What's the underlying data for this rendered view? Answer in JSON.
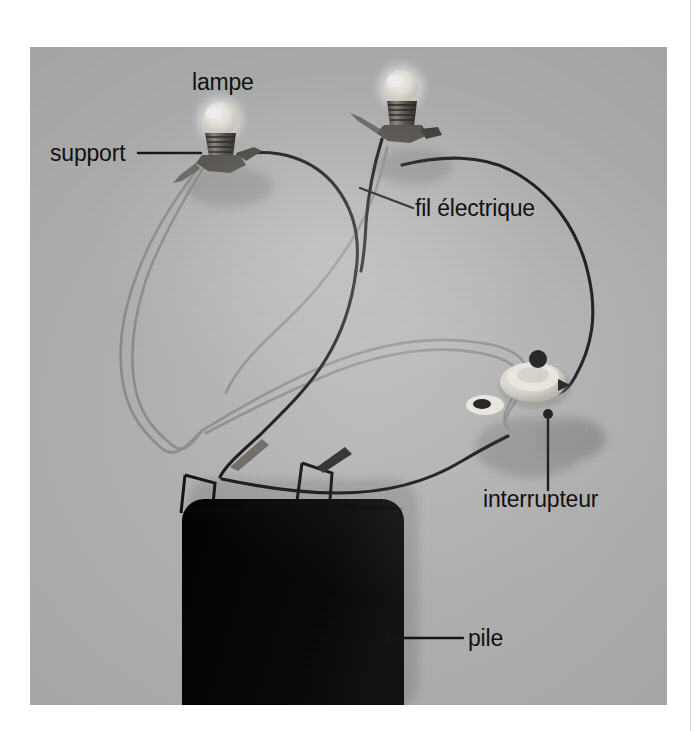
{
  "page": {
    "background_color": "#ffffff",
    "sheet_edge_color": "#d9d9d9"
  },
  "photo": {
    "caption_language": "fr",
    "subject": "montage de circuit electrique avec deux lampes, une pile et un interrupteur",
    "background_color": "#b7b7b7",
    "frame": {
      "x": 30,
      "y": 47,
      "width": 637,
      "height": 658
    }
  },
  "annotations": [
    {
      "id": "lampe",
      "label": "lampe",
      "name": "annotation-lampe",
      "leader": "none",
      "points_to": "ampoule de gauche"
    },
    {
      "id": "support",
      "label": "support",
      "name": "annotation-support",
      "leader": "horizontal",
      "points_to": "douille de la lampe de gauche"
    },
    {
      "id": "fil_electrique",
      "label": "fil électrique",
      "name": "annotation-fil-electrique",
      "leader": "diagonal",
      "points_to": "fil noir"
    },
    {
      "id": "interrupteur",
      "label": "interrupteur",
      "name": "annotation-interrupteur",
      "leader": "vertical-dot",
      "points_to": "interrupteur rond blanc"
    },
    {
      "id": "pile",
      "label": "pile",
      "name": "annotation-pile",
      "leader": "horizontal-dot",
      "points_to": "pile plate noire"
    }
  ],
  "components": [
    {
      "name": "lampe-gauche",
      "type": "ampoule",
      "color": "#efeae0"
    },
    {
      "name": "lampe-droite",
      "type": "ampoule",
      "color": "#efeae0"
    },
    {
      "name": "pile",
      "type": "pile plate",
      "color": "#0b0b0b"
    },
    {
      "name": "interrupteur",
      "type": "interrupteur rotatif",
      "color": "#e8e5dc"
    },
    {
      "name": "fil-noir",
      "type": "fil électrique",
      "color": "#1a1a1a"
    },
    {
      "name": "fil-gris",
      "type": "fil électrique",
      "color": "#8c8c8c"
    }
  ],
  "colors": {
    "label_text": "#111111",
    "leader_line": "#141414",
    "photo_bg": "#b7b7b7",
    "battery": "#0b0b0b",
    "wire_dark": "#1a1a1a",
    "wire_light": "#8f8f8f",
    "bulb_glass": "#f2efe8",
    "switch_body": "#e6e2d8"
  }
}
